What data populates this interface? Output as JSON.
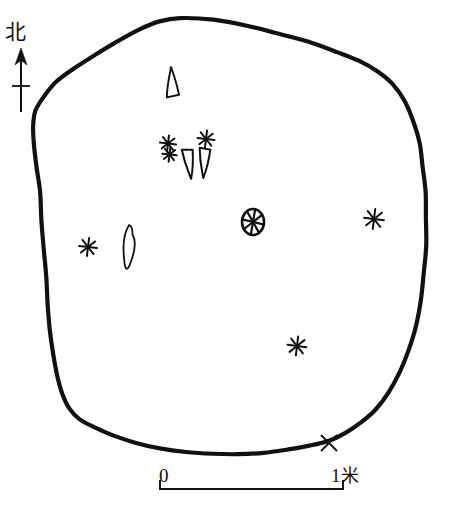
{
  "figure": {
    "type": "archaeological-site-plan",
    "background_color": "#ffffff",
    "ink_color": "#111111"
  },
  "north_indicator": {
    "label": "北",
    "meaning": "north",
    "arrow": {
      "x": 21,
      "tip_y": 48,
      "base_y": 112,
      "crossbar_y": 86,
      "crossbar_half_width": 9,
      "head_half_width": 6,
      "head_length": 17
    }
  },
  "scale_bar": {
    "left_label": "0",
    "right_value": "1",
    "right_unit": "米",
    "right_label": "1米",
    "unit_meaning": "meter",
    "x_start": 160,
    "x_end": 343,
    "y": 489,
    "tick_height": 9
  },
  "pit_outline": {
    "name": "pit-edge",
    "stroke_width": 4.2,
    "closed": true,
    "points": [
      [
        180,
        18
      ],
      [
        214,
        20
      ],
      [
        248,
        26
      ],
      [
        282,
        34
      ],
      [
        312,
        43
      ],
      [
        338,
        52
      ],
      [
        360,
        62
      ],
      [
        378,
        72
      ],
      [
        392,
        84
      ],
      [
        404,
        100
      ],
      [
        413,
        120
      ],
      [
        419,
        142
      ],
      [
        423,
        166
      ],
      [
        425,
        192
      ],
      [
        426,
        218
      ],
      [
        426,
        246
      ],
      [
        424,
        274
      ],
      [
        421,
        300
      ],
      [
        416,
        326
      ],
      [
        409,
        350
      ],
      [
        400,
        372
      ],
      [
        389,
        392
      ],
      [
        376,
        409
      ],
      [
        362,
        422
      ],
      [
        347,
        432
      ],
      [
        330,
        440
      ],
      [
        310,
        446
      ],
      [
        288,
        450
      ],
      [
        264,
        453
      ],
      [
        238,
        454
      ],
      [
        212,
        454
      ],
      [
        186,
        452
      ],
      [
        160,
        448
      ],
      [
        136,
        443
      ],
      [
        114,
        436
      ],
      [
        95,
        428
      ],
      [
        80,
        419
      ],
      [
        69,
        408
      ],
      [
        62,
        394
      ],
      [
        57,
        376
      ],
      [
        53,
        354
      ],
      [
        50,
        330
      ],
      [
        48,
        304
      ],
      [
        46,
        276
      ],
      [
        44,
        248
      ],
      [
        42,
        220
      ],
      [
        40,
        192
      ],
      [
        37,
        166
      ],
      [
        34,
        144
      ],
      [
        33,
        126
      ],
      [
        36,
        110
      ],
      [
        44,
        96
      ],
      [
        57,
        82
      ],
      [
        74,
        68
      ],
      [
        94,
        55
      ],
      [
        116,
        42
      ],
      [
        140,
        30
      ],
      [
        160,
        22
      ]
    ]
  },
  "artifacts": [
    {
      "id": "tooth-upper",
      "name": "tooth-outline-upper",
      "kind": "tooth",
      "label": "animal tooth",
      "x": 172,
      "y": 82,
      "width": 13,
      "height": 30,
      "rotation": -4
    },
    {
      "id": "star-double",
      "name": "star-marker-double",
      "kind": "star-double",
      "label": "find-spot cluster",
      "x": 168,
      "y": 149,
      "size": 17
    },
    {
      "id": "star-upper-right",
      "name": "star-marker-upper-right",
      "kind": "star",
      "label": "find-spot",
      "x": 206,
      "y": 139,
      "size": 17
    },
    {
      "id": "tusk-left",
      "name": "tusk-outline-left",
      "kind": "tusk",
      "label": "tusk fragment",
      "x": 189,
      "y": 164,
      "width": 12,
      "height": 30,
      "rotation": -7
    },
    {
      "id": "tusk-right",
      "name": "tusk-outline-right",
      "kind": "tusk",
      "label": "tusk fragment",
      "x": 204,
      "y": 163,
      "width": 12,
      "height": 30,
      "rotation": 4
    },
    {
      "id": "whorl",
      "name": "spoked-whorl",
      "kind": "whorl",
      "label": "spindle whorl",
      "x": 253,
      "y": 222,
      "radius_x": 11,
      "radius_y": 13,
      "spokes": 8
    },
    {
      "id": "star-right",
      "name": "star-marker-right",
      "kind": "star",
      "label": "find-spot",
      "x": 374,
      "y": 219,
      "size": 20
    },
    {
      "id": "star-left",
      "name": "star-marker-left",
      "kind": "star",
      "label": "find-spot",
      "x": 88,
      "y": 247,
      "size": 18
    },
    {
      "id": "blade",
      "name": "blade-outline",
      "kind": "blade",
      "label": "bone blade",
      "x": 128,
      "y": 247,
      "width": 16,
      "height": 44,
      "rotation": 6
    },
    {
      "id": "star-lower",
      "name": "star-marker-lower",
      "kind": "star",
      "label": "find-spot",
      "x": 297,
      "y": 346,
      "size": 19
    },
    {
      "id": "x-mark",
      "name": "x-mark-edge",
      "kind": "x",
      "label": "datum / section point",
      "x": 329,
      "y": 443,
      "size": 15
    }
  ]
}
